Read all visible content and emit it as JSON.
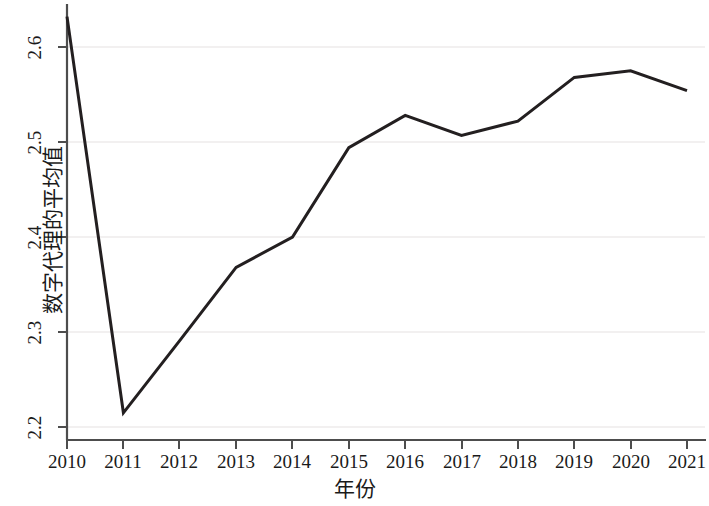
{
  "chart_data": {
    "type": "line",
    "title": "",
    "xlabel": "年份",
    "ylabel": "数字代理的平均值",
    "categories": [
      "2010",
      "2011",
      "2012",
      "2013",
      "2014",
      "2015",
      "2016",
      "2017",
      "2018",
      "2019",
      "2020",
      "2021"
    ],
    "x": [
      2010,
      2011,
      2012,
      2013,
      2014,
      2015,
      2016,
      2017,
      2018,
      2019,
      2020,
      2021
    ],
    "values": [
      2.632,
      2.215,
      2.291,
      2.368,
      2.4,
      2.494,
      2.528,
      2.507,
      2.522,
      2.568,
      2.575,
      2.554
    ],
    "series": [
      {
        "name": "数字代理的平均值",
        "values": [
          2.632,
          2.215,
          2.291,
          2.368,
          2.4,
          2.494,
          2.528,
          2.507,
          2.522,
          2.568,
          2.575,
          2.554
        ]
      }
    ],
    "ylim": [
      2.17,
      2.645
    ],
    "xlim": [
      2010,
      2021
    ],
    "yticks": [
      2.2,
      2.3,
      2.4,
      2.5,
      2.6
    ],
    "ytick_labels": [
      "2.2",
      "2.3",
      "2.4",
      "2.5",
      "2.6"
    ],
    "xticks": [
      2010,
      2011,
      2012,
      2013,
      2014,
      2015,
      2016,
      2017,
      2018,
      2019,
      2020,
      2021
    ],
    "xtick_labels": [
      "2010",
      "2011",
      "2012",
      "2013",
      "2014",
      "2015",
      "2016",
      "2017",
      "2018",
      "2019",
      "2020",
      "2021"
    ],
    "grid": "horizontal-faint",
    "legend": "none",
    "line_color": "#231f20",
    "line_width": 3,
    "background_color": "#ffffff",
    "axis_color": "#4d4d4d"
  },
  "axes": {
    "y_title": "数字代理的平均值",
    "x_title": "年份",
    "y_ticks": [
      {
        "label": "2.6",
        "value": 2.6
      },
      {
        "label": "2.5",
        "value": 2.5
      },
      {
        "label": "2.4",
        "value": 2.4
      },
      {
        "label": "2.3",
        "value": 2.3
      },
      {
        "label": "2.2",
        "value": 2.2
      }
    ],
    "x_ticks": [
      {
        "label": "2010"
      },
      {
        "label": "2011"
      },
      {
        "label": "2012"
      },
      {
        "label": "2013"
      },
      {
        "label": "2014"
      },
      {
        "label": "2015"
      },
      {
        "label": "2016"
      },
      {
        "label": "2017"
      },
      {
        "label": "2018"
      },
      {
        "label": "2019"
      },
      {
        "label": "2020"
      },
      {
        "label": "2021"
      }
    ]
  }
}
